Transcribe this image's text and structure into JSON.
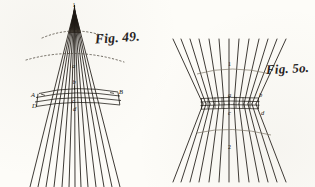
{
  "plate": {
    "background_color": "#fdfcf8",
    "ink_color": "#17140f",
    "figure_count": 2
  },
  "figures": [
    {
      "id": "fig-49",
      "caption": "Fig. 49.",
      "kind": "converging-cone-of-rays",
      "apex_marker": "1",
      "ray_count": 13,
      "labels": [
        {
          "key": "apex",
          "text": "1"
        },
        {
          "key": "axis_mid",
          "text": "a"
        },
        {
          "key": "band_top",
          "text": "b"
        },
        {
          "key": "band_center",
          "text": "c"
        },
        {
          "key": "band_right",
          "text": "B"
        },
        {
          "key": "band_left",
          "text": "A"
        },
        {
          "key": "band_lower_left",
          "text": "D"
        },
        {
          "key": "band_lower_center",
          "text": "d"
        }
      ],
      "dotted_arcs": 2,
      "band_grid_rows": 3
    },
    {
      "id": "fig-50",
      "caption": "Fig. 5o.",
      "kind": "hourglass-waist-of-rays",
      "ray_count": 13,
      "labels": [
        {
          "key": "upper_axis",
          "text": "1"
        },
        {
          "key": "lower_axis",
          "text": "2"
        },
        {
          "key": "waist_upper_center",
          "text": "a"
        },
        {
          "key": "waist_upper_right",
          "text": "b"
        },
        {
          "key": "waist_lower_center",
          "text": "c"
        },
        {
          "key": "waist_lower_right",
          "text": "d"
        }
      ],
      "faint_arcs": 2,
      "waist_grid_rows": 4
    }
  ]
}
